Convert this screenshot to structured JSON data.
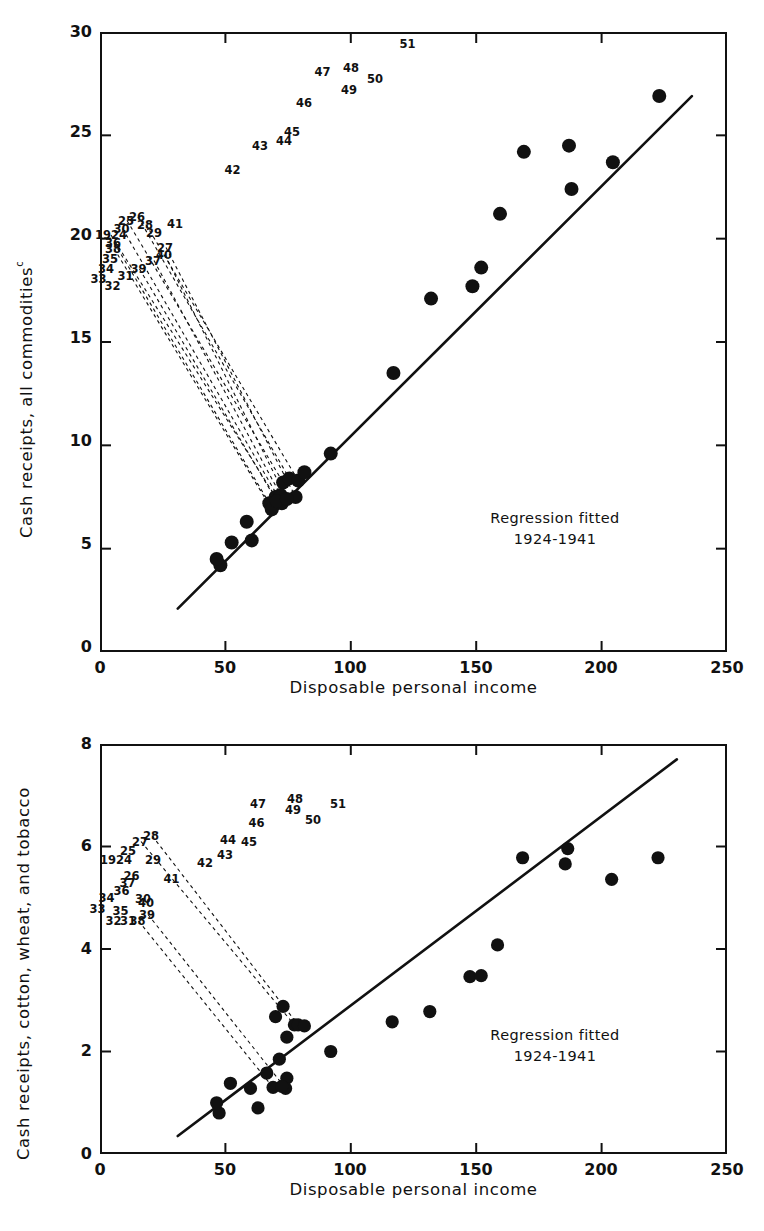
{
  "figure": {
    "background": "#ffffff",
    "ink": "#111111"
  },
  "charts": [
    {
      "id": "top",
      "ylabel": "Cash receipts, all commodities",
      "ylabel_sup": "c",
      "xlabel": "Disposable personal income",
      "note_line1": "Regression fitted",
      "note_line2": "1924-1941",
      "xticks": [
        "0",
        "50",
        "100",
        "150",
        "200",
        "250"
      ],
      "yticks": [
        "0",
        "5",
        "10",
        "15",
        "20",
        "25",
        "30"
      ]
    },
    {
      "id": "bottom",
      "ylabel": "Cash receipts, cotton, wheat, and tobacco",
      "ylabel_sup": "",
      "xlabel": "Disposable personal income",
      "note_line1": "Regression fitted",
      "note_line2": "1924-1941",
      "xticks": [
        "0",
        "50",
        "100",
        "150",
        "200",
        "250"
      ],
      "yticks": [
        "0",
        "2",
        "4",
        "6",
        "8"
      ]
    }
  ],
  "chart_data": [
    {
      "type": "scatter",
      "id": "cash-receipts-all-commodities",
      "title": "",
      "xlabel": "Disposable personal income",
      "ylabel": "Cash receipts, all commodities (c)",
      "xlim": [
        0,
        250
      ],
      "ylim": [
        0,
        30
      ],
      "xticks": [
        0,
        50,
        100,
        150,
        200,
        250
      ],
      "yticks": [
        0,
        5,
        10,
        15,
        20,
        25,
        30
      ],
      "grid": false,
      "legend": null,
      "annotations": [
        "Regression fitted",
        "1924-1941"
      ],
      "regression_line": {
        "x": [
          31,
          236
        ],
        "y": [
          2.1,
          26.9
        ]
      },
      "points": [
        {
          "label": "1924",
          "x": 70.0,
          "y": 7.5,
          "lx": 222,
          "ly": 470,
          "leader": true
        },
        {
          "label": "25",
          "x": 73.0,
          "y": 8.2,
          "lx": 254,
          "ly": 441,
          "leader": true
        },
        {
          "label": "26",
          "x": 75.5,
          "y": 8.4,
          "lx": 276,
          "ly": 434,
          "leader": true
        },
        {
          "label": "27",
          "x": 78.0,
          "y": 7.5,
          "lx": 332,
          "ly": 495,
          "leader": true
        },
        {
          "label": "28",
          "x": 79.0,
          "y": 8.3,
          "lx": 292,
          "ly": 449,
          "leader": true
        },
        {
          "label": "29",
          "x": 81.5,
          "y": 8.7,
          "lx": 310,
          "ly": 465,
          "leader": false
        },
        {
          "label": "30",
          "x": 72.5,
          "y": 7.2,
          "lx": 245,
          "ly": 457,
          "leader": true
        },
        {
          "label": "31",
          "x": 60.5,
          "y": 5.4,
          "lx": 253,
          "ly": 551,
          "leader": false
        },
        {
          "label": "32",
          "x": 48.0,
          "y": 4.2,
          "lx": 227,
          "ly": 571,
          "leader": false
        },
        {
          "label": "33",
          "x": 46.5,
          "y": 4.5,
          "lx": 199,
          "ly": 557,
          "leader": false
        },
        {
          "label": "34",
          "x": 52.5,
          "y": 5.3,
          "lx": 214,
          "ly": 537,
          "leader": false
        },
        {
          "label": "35",
          "x": 58.5,
          "y": 6.3,
          "lx": 222,
          "ly": 518,
          "leader": false
        },
        {
          "label": "36",
          "x": 67.5,
          "y": 7.2,
          "lx": 228,
          "ly": 485,
          "leader": true
        },
        {
          "label": "37",
          "x": 72.0,
          "y": 7.6,
          "lx": 308,
          "ly": 521,
          "leader": true
        },
        {
          "label": "38",
          "x": 68.5,
          "y": 6.9,
          "lx": 228,
          "ly": 497,
          "leader": true
        },
        {
          "label": "39",
          "x": 70.5,
          "y": 7.3,
          "lx": 279,
          "ly": 538,
          "leader": true
        },
        {
          "label": "40",
          "x": 74.5,
          "y": 7.4,
          "lx": 330,
          "ly": 510,
          "leader": true
        },
        {
          "label": "41",
          "x": 92.0,
          "y": 9.6,
          "lx": 352,
          "ly": 447,
          "leader": false
        },
        {
          "label": "42",
          "x": 117.0,
          "y": 13.5,
          "lx": 467,
          "ly": 340,
          "leader": false
        },
        {
          "label": "43",
          "x": 132.0,
          "y": 17.1,
          "lx": 522,
          "ly": 291,
          "leader": false
        },
        {
          "label": "44",
          "x": 148.5,
          "y": 17.7,
          "lx": 570,
          "ly": 282,
          "leader": false
        },
        {
          "label": "45",
          "x": 152.0,
          "y": 18.6,
          "lx": 586,
          "ly": 264,
          "leader": false
        },
        {
          "label": "46",
          "x": 159.5,
          "y": 21.2,
          "lx": 610,
          "ly": 206,
          "leader": false
        },
        {
          "label": "47",
          "x": 169.0,
          "y": 24.2,
          "lx": 647,
          "ly": 143,
          "leader": false
        },
        {
          "label": "48",
          "x": 187.0,
          "y": 24.5,
          "lx": 704,
          "ly": 136,
          "leader": false
        },
        {
          "label": "49",
          "x": 188.0,
          "y": 22.4,
          "lx": 700,
          "ly": 180,
          "leader": false
        },
        {
          "label": "50",
          "x": 204.5,
          "y": 23.7,
          "lx": 752,
          "ly": 157,
          "leader": false
        },
        {
          "label": "51",
          "x": 223.0,
          "y": 26.9,
          "lx": 817,
          "ly": 88,
          "leader": false
        }
      ]
    },
    {
      "type": "scatter",
      "id": "cash-receipts-cotton-wheat-tobacco",
      "title": "",
      "xlabel": "Disposable personal income",
      "ylabel": "Cash receipts, cotton, wheat, and tobacco",
      "xlim": [
        0,
        250
      ],
      "ylim": [
        0,
        8
      ],
      "xticks": [
        0,
        50,
        100,
        150,
        200,
        250
      ],
      "yticks": [
        0,
        2,
        4,
        6,
        8
      ],
      "grid": false,
      "legend": null,
      "annotations": [
        "Regression fitted",
        "1924-1941"
      ],
      "regression_line": {
        "x": [
          31,
          230
        ],
        "y": [
          0.35,
          7.7
        ]
      },
      "points": [
        {
          "label": "1924",
          "x": 70.0,
          "y": 2.68,
          "lx": 232,
          "ly": 1029,
          "leader": false
        },
        {
          "label": "25",
          "x": 73.0,
          "y": 2.88,
          "lx": 258,
          "ly": 1011,
          "leader": false
        },
        {
          "label": "26",
          "x": 74.5,
          "y": 2.28,
          "lx": 265,
          "ly": 1062,
          "leader": false
        },
        {
          "label": "27",
          "x": 77.5,
          "y": 2.52,
          "lx": 282,
          "ly": 993,
          "leader": true
        },
        {
          "label": "28",
          "x": 79.0,
          "y": 2.52,
          "lx": 304,
          "ly": 981,
          "leader": true
        },
        {
          "label": "29",
          "x": 81.5,
          "y": 2.5,
          "lx": 308,
          "ly": 1030,
          "leader": false
        },
        {
          "label": "30",
          "x": 74.5,
          "y": 1.48,
          "lx": 288,
          "ly": 1108,
          "leader": false
        },
        {
          "label": "31",
          "x": 63.0,
          "y": 0.9,
          "lx": 258,
          "ly": 1152,
          "leader": false
        },
        {
          "label": "32",
          "x": 47.5,
          "y": 0.8,
          "lx": 229,
          "ly": 1152,
          "leader": false
        },
        {
          "label": "33",
          "x": 46.5,
          "y": 1.0,
          "lx": 197,
          "ly": 1128,
          "leader": false
        },
        {
          "label": "34",
          "x": 52.0,
          "y": 1.38,
          "lx": 215,
          "ly": 1106,
          "leader": false
        },
        {
          "label": "35",
          "x": 60.0,
          "y": 1.28,
          "lx": 243,
          "ly": 1131,
          "leader": false
        },
        {
          "label": "36",
          "x": 66.5,
          "y": 1.58,
          "lx": 245,
          "ly": 1092,
          "leader": false
        },
        {
          "label": "37",
          "x": 71.5,
          "y": 1.85,
          "lx": 257,
          "ly": 1075,
          "leader": false
        },
        {
          "label": "38",
          "x": 69.0,
          "y": 1.3,
          "lx": 277,
          "ly": 1152,
          "leader": true
        },
        {
          "label": "39",
          "x": 74.0,
          "y": 1.28,
          "lx": 296,
          "ly": 1139,
          "leader": true
        },
        {
          "label": "40",
          "x": 72.5,
          "y": 1.32,
          "lx": 294,
          "ly": 1116,
          "leader": false
        },
        {
          "label": "41",
          "x": 92.0,
          "y": 2.0,
          "lx": 345,
          "ly": 1068,
          "leader": false
        },
        {
          "label": "42",
          "x": 116.5,
          "y": 2.58,
          "lx": 412,
          "ly": 1035,
          "leader": false
        },
        {
          "label": "43",
          "x": 131.5,
          "y": 2.78,
          "lx": 452,
          "ly": 1020,
          "leader": false
        },
        {
          "label": "44",
          "x": 147.5,
          "y": 3.46,
          "lx": 458,
          "ly": 989,
          "leader": false
        },
        {
          "label": "45",
          "x": 152.0,
          "y": 3.48,
          "lx": 500,
          "ly": 993,
          "leader": false
        },
        {
          "label": "46",
          "x": 158.5,
          "y": 4.08,
          "lx": 515,
          "ly": 955,
          "leader": false
        },
        {
          "label": "47",
          "x": 168.5,
          "y": 5.78,
          "lx": 518,
          "ly": 917,
          "leader": false
        },
        {
          "label": "48",
          "x": 186.5,
          "y": 5.96,
          "lx": 592,
          "ly": 908,
          "leader": false
        },
        {
          "label": "49",
          "x": 185.5,
          "y": 5.66,
          "lx": 588,
          "ly": 930,
          "leader": false
        },
        {
          "label": "50",
          "x": 204.0,
          "y": 5.36,
          "lx": 628,
          "ly": 950,
          "leader": false
        },
        {
          "label": "51",
          "x": 222.5,
          "y": 5.78,
          "lx": 678,
          "ly": 918,
          "leader": false
        }
      ]
    }
  ]
}
